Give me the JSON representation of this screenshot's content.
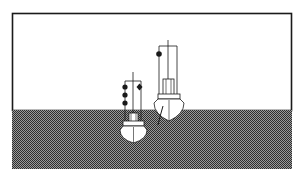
{
  "diagram": {
    "title": "",
    "colors": {
      "background": "#ffffff",
      "frame": "#1a1a1a",
      "water_dark": "#3a3a3a",
      "water_light": "#9a9a9a",
      "hull": "#ffffff",
      "line": "#1a1a1a"
    },
    "vessels": [
      {
        "id": "small-vessel",
        "position": "left, lower in water",
        "signals_left_yard": [
          "ball",
          "ball",
          "ball"
        ],
        "signals_right_yard": [
          "diamond"
        ]
      },
      {
        "id": "large-vessel",
        "position": "right, higher",
        "signals_left_yard": [
          "ball"
        ],
        "signals_right_yard": []
      }
    ]
  }
}
